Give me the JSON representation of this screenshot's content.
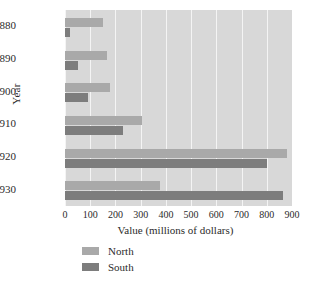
{
  "chart_data": {
    "type": "bar",
    "orientation": "horizontal",
    "title": "",
    "xlabel": "Value (millions of dollars)",
    "ylabel": "Year",
    "categories": [
      "1880",
      "1890",
      "1900",
      "1910",
      "1920",
      "1930"
    ],
    "series": [
      {
        "name": "North",
        "color": "#a9a9a9",
        "values": [
          150,
          165,
          180,
          305,
          880,
          375
        ]
      },
      {
        "name": "South",
        "color": "#7d7d7d",
        "values": [
          20,
          50,
          90,
          230,
          800,
          865
        ]
      }
    ],
    "xlim": [
      0,
      900
    ],
    "xticks": [
      0,
      100,
      200,
      300,
      400,
      500,
      600,
      700,
      800,
      900
    ],
    "xtick_labels": [
      "0",
      "100",
      "200",
      "300",
      "400",
      "500",
      "600",
      "700",
      "800",
      "900"
    ],
    "grid": "vertical-white",
    "legend_position": "below-axis-left",
    "plot_background": "#d8d8d8",
    "page_background": "#ffffff"
  },
  "legend": {
    "entries": [
      {
        "label": "North"
      },
      {
        "label": "South"
      }
    ]
  }
}
